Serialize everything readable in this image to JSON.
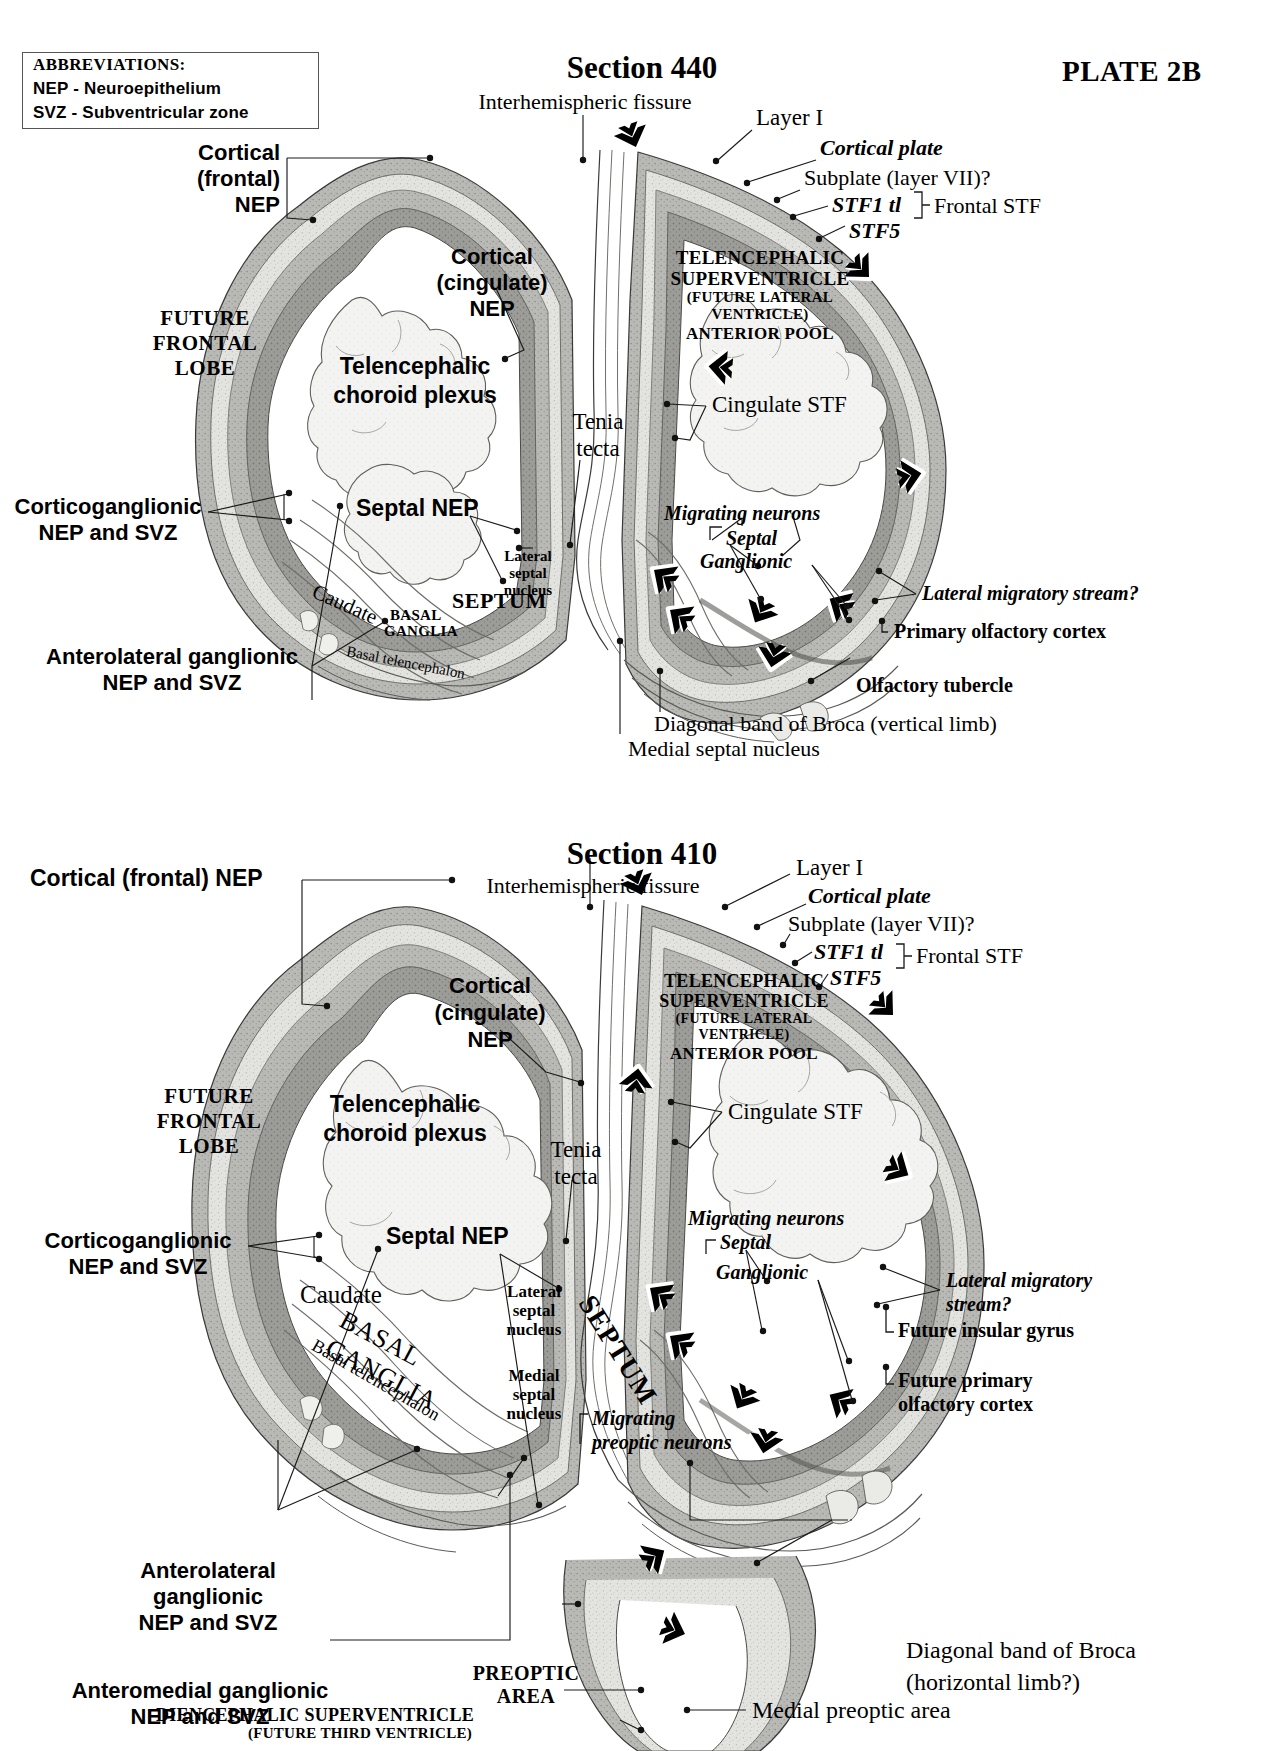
{
  "plate": {
    "id": "PLATE 2B",
    "abbreviations": {
      "heading": "ABBREVIATIONS:",
      "items": [
        "NEP - Neuroepithelium",
        "SVZ - Subventricular zone"
      ]
    }
  },
  "section_440": {
    "title": "Section 440",
    "labels": {
      "interhemispheric_fissure": "Interhemispheric fissure",
      "layer_i": "Layer I",
      "cortical_plate": "Cortical plate",
      "subplate": "Subplate (layer VII)?",
      "stf1_tl": "STF1 tl",
      "stf5": "STF5",
      "frontal_stf": "Frontal STF",
      "cortical_frontal_nep": "Cortical\n(frontal)\nNEP",
      "cortical_cingulate_nep": "Cortical\n(cingulate)\nNEP",
      "future_frontal_lobe": "FUTURE\nFRONTAL\nLOBE",
      "telencephalic_superventricle_l1": "TELENCEPHALIC",
      "telencephalic_superventricle_l2": "SUPERVENTRICLE",
      "telencephalic_superventricle_l3": "(FUTURE LATERAL",
      "telencephalic_superventricle_l4": "VENTRICLE)",
      "telencephalic_superventricle_l5": "ANTERIOR POOL",
      "telencephalic_choroid_plexus": "Telencephalic\nchoroid plexus",
      "cingulate_stf": "Cingulate STF",
      "tenia_tecta": "Tenia\ntecta",
      "corticoganglionic": "Corticoganglionic\nNEP and SVZ",
      "septal_nep": "Septal NEP",
      "lateral_septal_nucleus": "Lateral\nseptal\nnucleus",
      "septum": "SEPTUM",
      "caudate": "Caudate",
      "basal_ganglia_l1": "BASAL",
      "basal_ganglia_l2": "GANGLIA",
      "basal_telencephalon": "Basal telencephalon",
      "anterolateral_ganglionic": "Anterolateral ganglionic\nNEP and SVZ",
      "migrating_neurons": "Migrating neurons",
      "septal": "Septal",
      "ganglionic": "Ganglionic",
      "lateral_migratory_stream": "Lateral migratory stream?",
      "primary_olfactory_cortex": "Primary olfactory cortex",
      "olfactory_tubercle": "Olfactory tubercle",
      "diagonal_band_of_broca": "Diagonal band of Broca (vertical limb)",
      "medial_septal_nucleus": "Medial septal nucleus"
    }
  },
  "section_410": {
    "title": "Section 410",
    "labels": {
      "interhemispheric_fissure": "Interhemispheric fissure",
      "layer_i": "Layer I",
      "cortical_plate": "Cortical plate",
      "subplate": "Subplate (layer VII)?",
      "stf1_tl": "STF1 tl",
      "stf5": "STF5",
      "frontal_stf": "Frontal STF",
      "cortical_frontal_nep": "Cortical (frontal) NEP",
      "cortical_cingulate_nep": "Cortical\n(cingulate)\nNEP",
      "future_frontal_lobe": "FUTURE\nFRONTAL\nLOBE",
      "telencephalic_superventricle_l1": "TELENCEPHALIC",
      "telencephalic_superventricle_l2": "SUPERVENTRICLE",
      "telencephalic_superventricle_l3": "(FUTURE LATERAL",
      "telencephalic_superventricle_l4": "VENTRICLE)",
      "telencephalic_superventricle_l5": "ANTERIOR POOL",
      "telencephalic_choroid_plexus": "Telencephalic\nchoroid plexus",
      "cingulate_stf": "Cingulate STF",
      "tenia_tecta": "Tenia\ntecta",
      "corticoganglionic": "Corticoganglionic\nNEP and SVZ",
      "septal_nep": "Septal NEP",
      "lateral_septal_nucleus": "Lateral\nseptal\nnucleus",
      "medial_septal_nucleus": "Medial\nseptal\nnucleus",
      "septum": "SEPTUM",
      "caudate": "Caudate",
      "basal_ganglia_l1": "BASAL",
      "basal_ganglia_l2": "GANGLIA",
      "basal_telencephalon": "Basal telencephalon",
      "anterolateral_ganglionic": "Anterolateral\nganglionic\nNEP and SVZ",
      "anteromedial_ganglionic": "Anteromedial ganglionic\nNEP and SVZ",
      "migrating_neurons": "Migrating neurons",
      "septal": "Septal",
      "ganglionic": "Ganglionic",
      "lateral_migratory_stream": "Lateral migratory\nstream?",
      "future_insular_gyrus": "Future insular gyrus",
      "future_primary_olfactory_cortex": "Future primary\nolfactory cortex",
      "migrating_preoptic_neurons": "Migrating\npreoptic neurons",
      "preoptic_area": "PREOPTIC\nAREA",
      "diencephalic_superventricle_l1": "DIENCEPHALIC SUPERVENTRICLE",
      "diencephalic_superventricle_l2": "(FUTURE THIRD VENTRICLE)",
      "diagonal_band_of_broca_l1": "Diagonal band of Broca",
      "diagonal_band_of_broca_l2": "(horizontal limb?)",
      "medial_preoptic_area": "Medial preoptic area"
    }
  },
  "colors": {
    "ink": "#111111",
    "tissue_light": "#e9e9e7",
    "tissue_mid": "#c9c9c6",
    "tissue_dark": "#9a9a96",
    "nep_band": "#8d8d8a",
    "ventricle": "#ffffff"
  }
}
